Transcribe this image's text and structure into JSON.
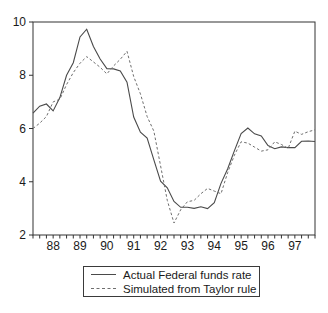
{
  "figure": {
    "background": "#ffffff",
    "frame_color": "#333333",
    "text_color": "#1a1a1a"
  },
  "chart_data": {
    "type": "line",
    "title": "",
    "xlabel": "",
    "ylabel": "",
    "grid": false,
    "legend_position": "bottom-center-boxed",
    "ylim": [
      2,
      10
    ],
    "yticks": [
      2,
      4,
      6,
      8,
      10
    ],
    "xticklabels": [
      "88",
      "89",
      "90",
      "91",
      "92",
      "93",
      "94",
      "95",
      "96",
      "97"
    ],
    "x_frequency": "quarterly",
    "x": [
      "1987Q2",
      "1987Q3",
      "1987Q4",
      "1988Q1",
      "1988Q2",
      "1988Q3",
      "1988Q4",
      "1989Q1",
      "1989Q2",
      "1989Q3",
      "1989Q4",
      "1990Q1",
      "1990Q2",
      "1990Q3",
      "1990Q4",
      "1991Q1",
      "1991Q2",
      "1991Q3",
      "1991Q4",
      "1992Q1",
      "1992Q2",
      "1992Q3",
      "1992Q4",
      "1993Q1",
      "1993Q2",
      "1993Q3",
      "1993Q4",
      "1994Q1",
      "1994Q2",
      "1994Q3",
      "1994Q4",
      "1995Q1",
      "1995Q2",
      "1995Q3",
      "1995Q4",
      "1996Q1",
      "1996Q2",
      "1996Q3",
      "1996Q4",
      "1997Q1",
      "1997Q2",
      "1997Q3",
      "1997Q4"
    ],
    "series": [
      {
        "name": "Actual Federal funds rate",
        "style": "solid",
        "color": "#4a4a4a",
        "values": [
          6.58,
          6.84,
          6.92,
          6.66,
          7.16,
          8.0,
          8.47,
          9.44,
          9.73,
          9.08,
          8.61,
          8.25,
          8.24,
          8.16,
          7.74,
          6.43,
          5.86,
          5.64,
          4.82,
          4.02,
          3.77,
          3.26,
          3.04,
          3.04,
          3.0,
          3.06,
          2.99,
          3.21,
          3.94,
          4.49,
          5.17,
          5.81,
          6.02,
          5.8,
          5.72,
          5.36,
          5.24,
          5.31,
          5.28,
          5.28,
          5.52,
          5.53,
          5.51
        ]
      },
      {
        "name": "Simulated from Taylor rule",
        "style": "dashed",
        "color": "#6e6e6e",
        "values": [
          6.0,
          6.2,
          6.45,
          7.0,
          7.1,
          7.65,
          8.1,
          8.45,
          8.7,
          8.5,
          8.3,
          8.05,
          8.35,
          8.6,
          8.9,
          7.95,
          7.3,
          6.45,
          5.9,
          4.6,
          3.3,
          2.45,
          2.95,
          3.25,
          3.3,
          3.55,
          3.75,
          3.65,
          3.55,
          4.35,
          5.0,
          5.5,
          5.45,
          5.3,
          5.15,
          5.2,
          5.5,
          5.4,
          5.25,
          5.9,
          5.78,
          5.88,
          5.95
        ]
      }
    ]
  }
}
